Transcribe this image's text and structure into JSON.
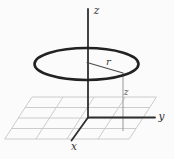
{
  "figure": {
    "colors": {
      "background": "#fbfbfb",
      "axis": "#2e2e2e",
      "grid": "#c6c6c6",
      "loop": "#222222"
    },
    "labels": {
      "z_axis": "z",
      "y_axis": "y",
      "x_axis": "x",
      "radius": "r",
      "height": "z"
    }
  }
}
